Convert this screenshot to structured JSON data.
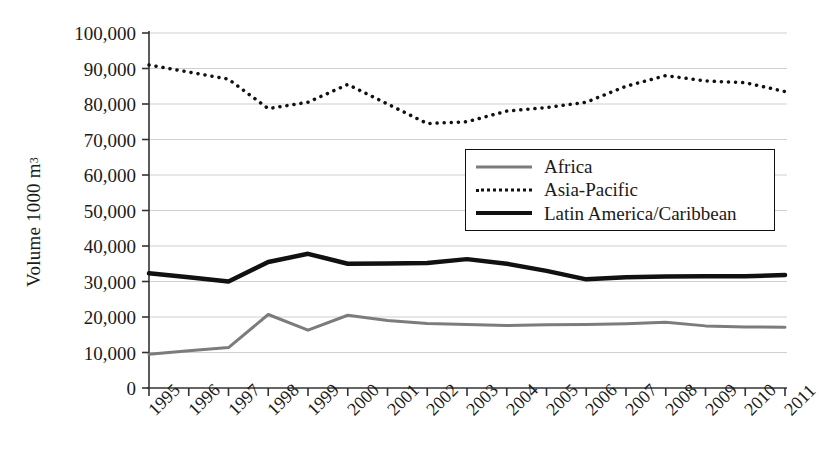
{
  "chart_data": {
    "type": "line",
    "title": "",
    "xlabel": "",
    "ylabel": "Volume 1000 m",
    "ylabel_sup": "3",
    "x": [
      1995,
      1996,
      1997,
      1998,
      1999,
      2000,
      2001,
      2002,
      2003,
      2004,
      2005,
      2006,
      2007,
      2008,
      2009,
      2010,
      2011
    ],
    "xtick_labels": [
      "1995",
      "1996",
      "1997",
      "1998",
      "1999",
      "2000",
      "2001",
      "2002",
      "2003",
      "2004",
      "2005",
      "2006",
      "2007",
      "2008",
      "2009",
      "2010",
      "2011"
    ],
    "ylim": [
      0,
      100000
    ],
    "yticks": [
      0,
      10000,
      20000,
      30000,
      40000,
      50000,
      60000,
      70000,
      80000,
      90000,
      100000
    ],
    "ytick_labels": [
      "0",
      "10,000",
      "20,000",
      "30,000",
      "40,000",
      "50,000",
      "60,000",
      "70,000",
      "80,000",
      "90,000",
      "100,000"
    ],
    "grid": true,
    "legend_position": "center-right",
    "series": [
      {
        "name": "Africa",
        "color": "#7c7c7c",
        "style": "solid",
        "width": 3,
        "values": [
          9500,
          10500,
          11400,
          20700,
          16300,
          20500,
          19000,
          18200,
          17900,
          17600,
          17800,
          17900,
          18100,
          18500,
          17500,
          17200,
          17100
        ]
      },
      {
        "name": "Asia-Pacific",
        "color": "#111111",
        "style": "dotted",
        "width": 3.5,
        "values": [
          91000,
          89000,
          87000,
          78700,
          80500,
          85500,
          80000,
          74500,
          75000,
          78000,
          79000,
          80500,
          85000,
          88000,
          86500,
          86000,
          83500
        ]
      },
      {
        "name": "Latin America/Caribbean",
        "color": "#111111",
        "style": "solid",
        "width": 4.5,
        "values": [
          32300,
          31200,
          30000,
          35500,
          37800,
          35000,
          35100,
          35200,
          36300,
          35000,
          33000,
          30600,
          31200,
          31400,
          31500,
          31500,
          31800
        ]
      }
    ]
  }
}
